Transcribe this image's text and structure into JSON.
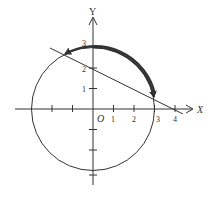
{
  "figure": {
    "axes": {
      "x_label": "X",
      "y_label": "Y",
      "origin_label": "O",
      "x_tick_labels": [
        "1",
        "2",
        "3",
        "4"
      ],
      "y_tick_labels": [
        "1",
        "2",
        "3"
      ]
    },
    "circle": {
      "center": [
        0,
        0
      ],
      "radius": 3
    },
    "line": {
      "equation": "y = 2 - x/2",
      "y_intercept": 2,
      "x_intercept": 4
    },
    "arc": {
      "from": [
        -1.35,
        2.68
      ],
      "to": [
        2.95,
        0.52
      ],
      "direction": "both-arrows"
    },
    "colors": {
      "stroke": "#333333",
      "background": "#ffffff"
    }
  }
}
